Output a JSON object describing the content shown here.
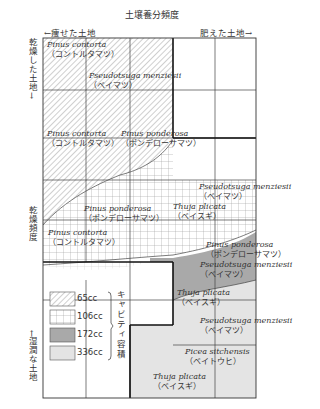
{
  "diagram": {
    "title": "土壌養分頻度",
    "x_axis": {
      "left_label": "←痩せた土地",
      "right_label": "肥えた土地→"
    },
    "y_axis": {
      "top_label": "乾燥した土地→",
      "middle_label": "乾燥頻度",
      "bottom_label": "←湿潤な土地"
    },
    "regions": [
      {
        "latin": "Pinus contorta",
        "japanese": "（コントルタマツ）"
      },
      {
        "latin": "Pseudotsuga menziesii",
        "japanese": "（ベイマツ）"
      },
      {
        "latin": "Pinus contorta",
        "japanese": "（コントルタマツ）"
      },
      {
        "latin": "Pinus ponderosa",
        "japanese": "（ポンデローサマツ）"
      },
      {
        "latin": "Pseudotsuga menziesii",
        "japanese": "（ベイマツ）"
      },
      {
        "latin": "Pinus ponderosa",
        "japanese": "（ポンデローサマツ）"
      },
      {
        "latin": "Thuja plicata",
        "japanese": "（ベイスギ）"
      },
      {
        "latin": "Pinus contorta",
        "japanese": "（コントルタマツ）"
      },
      {
        "latin": "Pinus ponderosa",
        "japanese": "（ポンデローサマツ）"
      },
      {
        "latin": "Pseudotsuga menziesii",
        "japanese": "（ベイマツ）"
      },
      {
        "latin": "Thuja plicata",
        "japanese": "（ベイスギ）"
      },
      {
        "latin": "Pseudotsuga menziesii",
        "japanese": "（ベイマツ）"
      },
      {
        "latin": "Picea sitchensis",
        "japanese": "（ベイトウヒ）"
      },
      {
        "latin": "Thuja plicata",
        "japanese": "（ベイスギ）"
      }
    ],
    "legend": {
      "title": "キャビティ容積",
      "items": [
        {
          "label": "65cc",
          "pattern": "diagonal-hatch",
          "color": "#ffffff"
        },
        {
          "label": "106cc",
          "pattern": "grid",
          "color": "#ffffff"
        },
        {
          "label": "172cc",
          "pattern": "solid",
          "color": "#a9a9a9"
        },
        {
          "label": "336cc",
          "pattern": "solid",
          "color": "#e4e4e4"
        }
      ]
    }
  }
}
